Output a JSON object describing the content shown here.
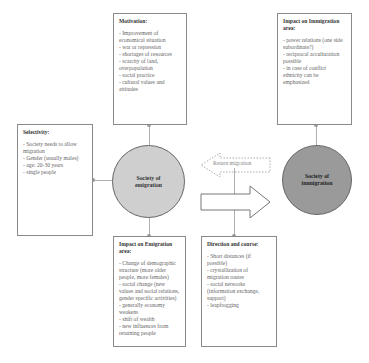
{
  "diagram": {
    "nodes": {
      "motivation": {
        "title": "Motivation:",
        "items": [
          "- Improvement of economical situation",
          "- war or repression",
          "- shortages of resources",
          "- scarcity of land, overpopulation",
          "- social practice",
          "- cultural values and attitudes"
        ]
      },
      "impact_immigration": {
        "title": "Impact on Immigration area:",
        "items": [
          "- power relations (one side subordinate?)",
          "- reciprocal acculturation possible",
          "- in case of conflict ethnicity can be emphasized"
        ]
      },
      "selectivity": {
        "title": "Selectivity:",
        "items": [
          "- Society needs to allow migration",
          "- Gender (usually males)",
          "- age: 20-30 years",
          "- single people"
        ]
      },
      "society_emigration": {
        "label": "Society of emigration"
      },
      "society_immigration": {
        "label": "Society of immigration"
      },
      "return_migration": {
        "label": "Return migration"
      },
      "impact_emigration": {
        "title": "Impact on Emigration area:",
        "items": [
          "- Change of demographic structure (more older people, more females)",
          "- social change (new values and social relations, gender specific activities)",
          "- generally economy weakens",
          "- shift of wealth",
          "- new influences from returning people"
        ]
      },
      "direction": {
        "title": "Direction and course:",
        "items": [
          "- Short distances (if possible)",
          "- crystallization of migration routes",
          "- social networks (information exchange, support)",
          "- leapfrogging"
        ]
      }
    },
    "edges": [
      {
        "from": "motivation",
        "to": "society_emigration",
        "style": "line"
      },
      {
        "from": "selectivity",
        "to": "society_emigration",
        "style": "line"
      },
      {
        "from": "society_emigration",
        "to": "impact_emigration",
        "style": "line"
      },
      {
        "from": "society_emigration",
        "to": "society_immigration",
        "style": "block-arrow"
      },
      {
        "from": "society_immigration",
        "to": "society_emigration",
        "style": "dashed-arrow",
        "label": "Return migration"
      },
      {
        "from": "impact_immigration",
        "to": "society_immigration",
        "style": "line"
      },
      {
        "from": "direction",
        "to": "block-arrow",
        "style": "line"
      }
    ],
    "colors": {
      "emigration_fill": "#cfcfcf",
      "immigration_fill": "#9a9a9a",
      "box_border": "#8a8a8a"
    }
  }
}
